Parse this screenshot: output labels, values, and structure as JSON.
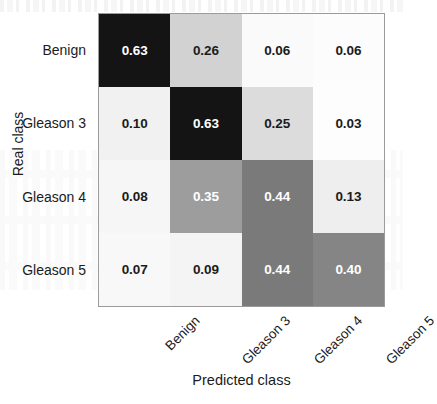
{
  "figure": {
    "background_color": "#ffffff",
    "border_color": "#9b9b9b"
  },
  "axes": {
    "y_title": "Real class",
    "x_title": "Predicted class",
    "y_ticks": [
      "Benign",
      "Gleason 3",
      "Gleason 4",
      "Gleason 5"
    ],
    "x_ticks": [
      "Benign",
      "Gleason 3",
      "Gleason 4",
      "Gleason 5"
    ]
  },
  "cells": [
    {
      "text": "0.63",
      "bg": "#141414",
      "fg": "#ffffff"
    },
    {
      "text": "0.26",
      "bg": "#d2d2d2",
      "fg": "#1b1b1b"
    },
    {
      "text": "0.06",
      "bg": "#fafafa",
      "fg": "#1b1b1b"
    },
    {
      "text": "0.06",
      "bg": "#fcfcfc",
      "fg": "#1b1b1b"
    },
    {
      "text": "0.10",
      "bg": "#f1f1f1",
      "fg": "#1b1b1b"
    },
    {
      "text": "0.63",
      "bg": "#141414",
      "fg": "#ffffff"
    },
    {
      "text": "0.25",
      "bg": "#dcdcdc",
      "fg": "#1b1b1b"
    },
    {
      "text": "0.03",
      "bg": "#fdfdfd",
      "fg": "#1b1b1b"
    },
    {
      "text": "0.08",
      "bg": "#f6f6f6",
      "fg": "#1b1b1b"
    },
    {
      "text": "0.35",
      "bg": "#9d9d9d",
      "fg": "#ffffff"
    },
    {
      "text": "0.44",
      "bg": "#7a7a7a",
      "fg": "#ffffff"
    },
    {
      "text": "0.13",
      "bg": "#eeeeee",
      "fg": "#1b1b1b"
    },
    {
      "text": "0.07",
      "bg": "#f8f8f8",
      "fg": "#1b1b1b"
    },
    {
      "text": "0.09",
      "bg": "#f4f4f4",
      "fg": "#1b1b1b"
    },
    {
      "text": "0.44",
      "bg": "#7a7a7a",
      "fg": "#ffffff"
    },
    {
      "text": "0.40",
      "bg": "#858585",
      "fg": "#ffffff"
    }
  ],
  "chart_data": {
    "type": "heatmap",
    "title": "",
    "xlabel": "Predicted class",
    "ylabel": "Real class",
    "x_categories": [
      "Benign",
      "Gleason 3",
      "Gleason 4",
      "Gleason 5"
    ],
    "y_categories": [
      "Benign",
      "Gleason 3",
      "Gleason 4",
      "Gleason 5"
    ],
    "values": [
      [
        0.63,
        0.26,
        0.06,
        0.06
      ],
      [
        0.1,
        0.63,
        0.25,
        0.03
      ],
      [
        0.08,
        0.35,
        0.44,
        0.13
      ],
      [
        0.07,
        0.09,
        0.44,
        0.4
      ]
    ],
    "cell_labels": [
      [
        "0.63",
        "0.26",
        "0.06",
        "0.06"
      ],
      [
        "0.10",
        "0.63",
        "0.25",
        "0.03"
      ],
      [
        "0.08",
        "0.35",
        "0.44",
        "0.13"
      ],
      [
        "0.07",
        "0.09",
        "0.44",
        "0.40"
      ]
    ],
    "colormap": "grayscale-reversed",
    "vmin": 0.0,
    "vmax": 0.63,
    "grid": false,
    "legend": "none",
    "annotations": "each cell annotated with its value to two decimals"
  }
}
